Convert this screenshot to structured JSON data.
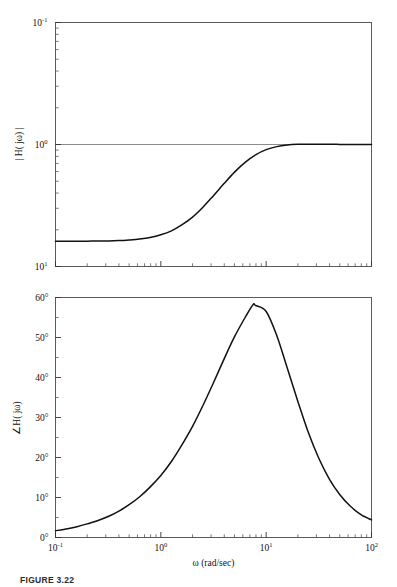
{
  "figure": {
    "caption": "FIGURE 3.22",
    "xlabel": "ω (rad/sec)"
  },
  "magnitude_plot": {
    "ylabel": "| H( jω) |",
    "y_ticks": [
      "10",
      "10",
      "10"
    ],
    "y_tick_exps": [
      "1",
      "0",
      "-1"
    ],
    "y_tick_values": [
      10,
      1,
      0.1
    ],
    "gridline_at": "10^0"
  },
  "phase_plot": {
    "ylabel": "∠H( jω)",
    "y_ticks": [
      "60°",
      "50°",
      "40°",
      "30°",
      "20°",
      "10°",
      "0°"
    ],
    "x_ticks": [
      "10",
      "10",
      "10",
      "10"
    ],
    "x_tick_exps": [
      "-1",
      "0",
      "1",
      "2"
    ],
    "x_tick_values": [
      0.1,
      1,
      10,
      100
    ]
  },
  "chart_data": [
    {
      "type": "line",
      "title": "",
      "subtitle": "",
      "xlabel": "",
      "ylabel": "| H( jω) |",
      "xscale": "log",
      "yscale": "log",
      "xlim": [
        0.1,
        100
      ],
      "ylim": [
        0.1,
        10
      ],
      "xticks": [
        0.1,
        1,
        10,
        100
      ],
      "xticklabels": [
        "10^-1",
        "10^0",
        "10^1",
        "10^2"
      ],
      "yticks": [
        0.1,
        1,
        10
      ],
      "yticklabels": [
        "10^-1",
        "10^0",
        "10^1"
      ],
      "grid": "horizontal gridline at y = 1",
      "legend": "none",
      "series": [
        {
          "name": "|H(jw)|",
          "x": [
            0.1,
            0.13,
            0.16,
            0.2,
            0.25,
            0.32,
            0.4,
            0.5,
            0.63,
            0.79,
            1.0,
            1.26,
            1.58,
            2.0,
            2.51,
            3.16,
            3.98,
            5.01,
            6.31,
            7.94,
            10.0,
            12.6,
            15.8,
            20.0,
            25.1,
            31.6,
            39.8,
            50.1,
            63.1,
            79.4,
            100.0
          ],
          "y": [
            0.161,
            0.161,
            0.161,
            0.161,
            0.162,
            0.162,
            0.163,
            0.165,
            0.168,
            0.173,
            0.182,
            0.196,
            0.219,
            0.254,
            0.306,
            0.381,
            0.478,
            0.594,
            0.714,
            0.823,
            0.907,
            0.961,
            0.991,
            1.004,
            1.007,
            1.006,
            1.004,
            1.002,
            1.001,
            1.0,
            1.0
          ]
        }
      ],
      "annotations": [
        "low-frequency asymptote ≈ 0.16",
        "high-frequency asymptote = 1",
        "slight overshoot above 1 near ω ≈ 25 rad/sec"
      ]
    },
    {
      "type": "line",
      "title": "",
      "subtitle": "",
      "xlabel": "ω (rad/sec)",
      "ylabel": "∠H( jω)",
      "xscale": "log",
      "yscale": "linear",
      "xlim": [
        0.1,
        100
      ],
      "ylim": [
        0,
        60
      ],
      "xticks": [
        0.1,
        1,
        10,
        100
      ],
      "xticklabels": [
        "10^-1",
        "10^0",
        "10^1",
        "10^2"
      ],
      "yticks": [
        0,
        10,
        20,
        30,
        40,
        50,
        60
      ],
      "yticklabels": [
        "0°",
        "10°",
        "20°",
        "30°",
        "40°",
        "50°",
        "60°"
      ],
      "grid": "none",
      "legend": "none",
      "series": [
        {
          "name": "angle H(jw) (degrees)",
          "x": [
            0.1,
            0.13,
            0.16,
            0.2,
            0.25,
            0.32,
            0.4,
            0.5,
            0.63,
            0.79,
            1.0,
            1.26,
            1.58,
            2.0,
            2.51,
            3.16,
            3.98,
            5.01,
            6.31,
            7.5,
            7.94,
            10.0,
            12.6,
            15.8,
            20.0,
            25.1,
            31.6,
            39.8,
            50.1,
            63.1,
            79.4,
            100.0
          ],
          "y": [
            1.7,
            2.2,
            2.7,
            3.4,
            4.2,
            5.3,
            6.6,
            8.2,
            10.2,
            12.6,
            15.5,
            19.0,
            23.1,
            27.8,
            33.0,
            38.7,
            44.6,
            50.2,
            55.0,
            58.2,
            58.0,
            56.5,
            50.5,
            42.5,
            34.0,
            26.3,
            19.8,
            14.6,
            10.7,
            7.8,
            5.7,
            4.4
          ]
        }
      ],
      "annotations": [
        "peak ≈ 58° near ω ≈ 7.5 rad/sec"
      ]
    }
  ]
}
